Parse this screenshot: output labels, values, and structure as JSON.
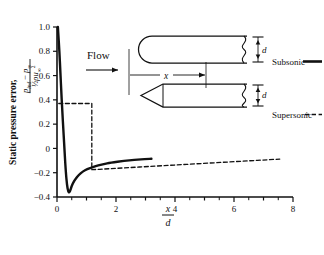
{
  "chart_data": {
    "type": "line",
    "title": "",
    "xlabel": "x/d",
    "ylabel": "Static pressure error, (p_ind - p_inf)/(1/2 rho u_inf^2)",
    "xlim": [
      0,
      8
    ],
    "ylim": [
      -0.4,
      1.0
    ],
    "grid": false,
    "legend_position": "right",
    "x_ticks": [
      {
        "value": 0,
        "label": "0"
      },
      {
        "value": 1,
        "label": ""
      },
      {
        "value": 2,
        "label": "2"
      },
      {
        "value": 3,
        "label": ""
      },
      {
        "value": 4,
        "label": "4"
      },
      {
        "value": 5,
        "label": ""
      },
      {
        "value": 6,
        "label": "6"
      },
      {
        "value": 7,
        "label": ""
      },
      {
        "value": 8,
        "label": "8"
      }
    ],
    "x_minor_ticks": [
      0.5,
      1.5,
      2.5,
      3.5,
      4.5,
      5.5,
      6.5,
      7.5
    ],
    "y_ticks": [
      {
        "value": 1.0,
        "label": "1.0"
      },
      {
        "value": 0.8,
        "label": "0.8"
      },
      {
        "value": 0.6,
        "label": "0.6"
      },
      {
        "value": 0.4,
        "label": "0.4"
      },
      {
        "value": 0.2,
        "label": "0.2"
      },
      {
        "value": 0.0,
        "label": "0"
      },
      {
        "value": -0.2,
        "label": "-0.2"
      },
      {
        "value": -0.4,
        "label": "-0.4"
      }
    ],
    "series": [
      {
        "name": "Subsonic",
        "style": "solid",
        "color": "#111111",
        "points": [
          [
            0.03,
            1.0
          ],
          [
            0.08,
            0.8
          ],
          [
            0.12,
            0.6
          ],
          [
            0.16,
            0.4
          ],
          [
            0.2,
            0.22
          ],
          [
            0.24,
            0.05
          ],
          [
            0.28,
            -0.12
          ],
          [
            0.32,
            -0.25
          ],
          [
            0.36,
            -0.33
          ],
          [
            0.4,
            -0.36
          ],
          [
            0.45,
            -0.345
          ],
          [
            0.5,
            -0.31
          ],
          [
            0.58,
            -0.27
          ],
          [
            0.68,
            -0.235
          ],
          [
            0.8,
            -0.205
          ],
          [
            0.95,
            -0.18
          ],
          [
            1.15,
            -0.16
          ],
          [
            1.4,
            -0.14
          ],
          [
            1.7,
            -0.123
          ],
          [
            2.05,
            -0.11
          ],
          [
            2.45,
            -0.098
          ],
          [
            2.85,
            -0.09
          ],
          [
            3.2,
            -0.085
          ]
        ]
      },
      {
        "name": "Supersonic",
        "style": "dashed",
        "color": "#111111",
        "points": [
          [
            0.06,
            0.37
          ],
          [
            1.18,
            0.37
          ],
          [
            1.18,
            -0.175
          ],
          [
            1.45,
            -0.172
          ],
          [
            2.0,
            -0.164
          ],
          [
            2.8,
            -0.153
          ],
          [
            3.6,
            -0.142
          ],
          [
            4.4,
            -0.131
          ],
          [
            5.2,
            -0.12
          ],
          [
            6.0,
            -0.109
          ],
          [
            6.8,
            -0.098
          ],
          [
            7.55,
            -0.088
          ]
        ]
      }
    ]
  },
  "annotations": {
    "flow_label": "Flow",
    "x_dimension_label": "x",
    "diameter_label": "d"
  },
  "legend": {
    "items": [
      {
        "label": "Subsonic",
        "style": "solid"
      },
      {
        "label": "Supersonic",
        "style": "dashed"
      }
    ]
  },
  "axis_labels": {
    "y_prefix": "Static pressure error,",
    "y_frac_numerator_p1": "p",
    "y_frac_numerator_sub1": "ind",
    "y_frac_numerator_minus": "−",
    "y_frac_numerator_p2": "p",
    "y_frac_numerator_sub2": "∞",
    "y_frac_denominator": "½ρu",
    "y_frac_denominator_sub": "∞",
    "y_frac_denominator_sup": "2",
    "x_numerator": "x",
    "x_denominator": "d"
  },
  "probes": {
    "subsonic_nose": "rounded",
    "supersonic_nose": "conical"
  }
}
